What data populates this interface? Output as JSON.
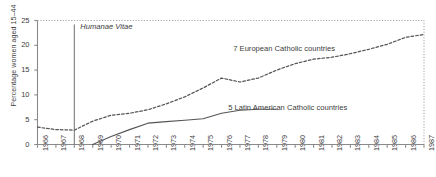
{
  "chart_data": {
    "type": "line",
    "title": "",
    "subtitle": "",
    "xlabel": "",
    "ylabel": "Percentage women aged 15–44",
    "xlim": [
      1966,
      1987
    ],
    "ylim": [
      0,
      25
    ],
    "yticks": [
      0,
      5,
      10,
      15,
      20,
      25
    ],
    "grid": false,
    "legend_position": "inline-annotation",
    "x": [
      1966,
      1967,
      1968,
      1969,
      1970,
      1971,
      1972,
      1973,
      1974,
      1975,
      1976,
      1977,
      1978,
      1979,
      1980,
      1981,
      1982,
      1983,
      1984,
      1985,
      1986,
      1987
    ],
    "xtick_labels": [
      "1966",
      "1967",
      "1968",
      "1969",
      "1970",
      "1971",
      "1972",
      "1973",
      "1974",
      "1975",
      "1976",
      "1977",
      "1978",
      "1979",
      "1980",
      "1981",
      "1982",
      "1983",
      "1984",
      "1985",
      "1986",
      "1987"
    ],
    "series": [
      {
        "name": "7 European Catholic countries",
        "style": "dashed",
        "color": "#555555",
        "label_x": 1979.4,
        "label_y": 19.2,
        "values": [
          3.5,
          3.0,
          2.9,
          4.7,
          5.9,
          6.3,
          7.0,
          8.2,
          9.6,
          11.4,
          13.4,
          12.6,
          13.4,
          15.0,
          16.3,
          17.2,
          17.6,
          18.3,
          19.2,
          20.2,
          21.6,
          22.2
        ]
      },
      {
        "name": "5 Latin American Catholic countries",
        "style": "solid",
        "color": "#555555",
        "label_x": 1979.6,
        "label_y": 7.4,
        "values": [
          null,
          null,
          null,
          0.0,
          1.6,
          3.0,
          4.3,
          4.6,
          4.9,
          5.2,
          6.3,
          6.9,
          7.1,
          7.1,
          null,
          null,
          null,
          null,
          null,
          null,
          null,
          null
        ]
      }
    ],
    "annotations": [
      {
        "name": "humanae-vitae",
        "text": "Humanae Vitae",
        "x": 1968,
        "y_top": 24.2,
        "y_bottom": 0,
        "style": "vertical-line-italic-label"
      }
    ]
  },
  "axes": {
    "y_tick_labels": [
      "0",
      "5",
      "10",
      "15",
      "20",
      "25"
    ],
    "y_axis_title": "Percentage women aged 15–44"
  },
  "colors": {
    "axis": "#8a8a8a",
    "line": "#555555",
    "text": "#3d3d3d",
    "background": "#ffffff",
    "border_dotted": "#9a9a9a"
  }
}
